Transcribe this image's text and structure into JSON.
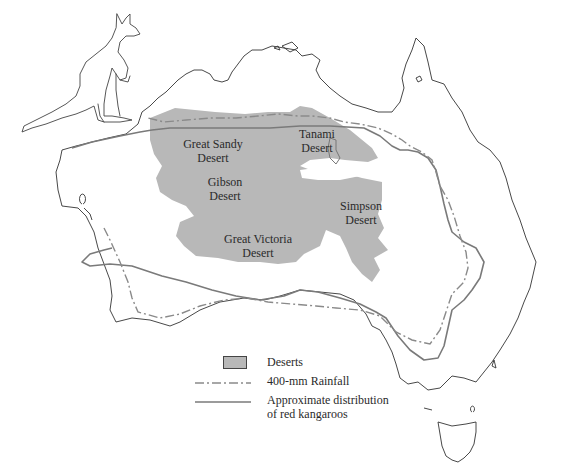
{
  "map": {
    "subject": "Australia",
    "deserts": [
      {
        "name": "Great Sandy Desert",
        "label": "Great Sandy\nDesert"
      },
      {
        "name": "Tanami Desert",
        "label": "Tanami\nDesert"
      },
      {
        "name": "Gibson Desert",
        "label": "Gibson\nDesert"
      },
      {
        "name": "Simpson Desert",
        "label": "Simpson\nDesert"
      },
      {
        "name": "Great Victoria Desert",
        "label": "Great Victoria\nDesert"
      }
    ],
    "colors": {
      "desert_fill": "#b8b8b8",
      "coastline": "#333333",
      "kangaroo_range": "#7a7a7a",
      "rainfall_line": "#8a8a8a"
    }
  },
  "legend": {
    "items": [
      {
        "symbol": "filled-gray-box",
        "label": "Deserts"
      },
      {
        "symbol": "dash-dot-line",
        "label": "400-mm Rainfall"
      },
      {
        "symbol": "solid-line",
        "label": "Approximate distribution\nof red kangaroos"
      }
    ]
  },
  "illustration": {
    "icon": "kangaroo-illustration"
  }
}
